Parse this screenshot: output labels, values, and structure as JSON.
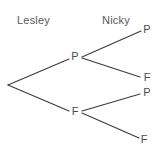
{
  "diagram": {
    "type": "probability-tree",
    "title": "",
    "background_color": "#ffffff",
    "line_color": "#3b3b3d",
    "text_color": "#58595b",
    "columns": [
      {
        "id": "lesley",
        "label": "Lesley",
        "x": 17,
        "y": 14
      },
      {
        "id": "nicky",
        "label": "Nicky",
        "x": 102,
        "y": 14
      }
    ],
    "nodes": [
      {
        "id": "root",
        "label": "",
        "stage": 0,
        "x": 8,
        "y": 85
      },
      {
        "id": "l-p",
        "label": "P",
        "stage": 1,
        "x": 75,
        "y": 57
      },
      {
        "id": "l-f",
        "label": "F",
        "stage": 1,
        "x": 75,
        "y": 112
      },
      {
        "id": "n-p-p",
        "label": "P",
        "stage": 2,
        "x": 147,
        "y": 30
      },
      {
        "id": "n-p-f",
        "label": "F",
        "stage": 2,
        "x": 147,
        "y": 78
      },
      {
        "id": "n-f-p",
        "label": "P",
        "stage": 2,
        "x": 147,
        "y": 93
      },
      {
        "id": "n-f-f",
        "label": "F",
        "stage": 2,
        "x": 144,
        "y": 140
      }
    ],
    "edges": [
      {
        "id": "root-to-l-p",
        "from": "root",
        "to": "l-p",
        "x1": 8,
        "y1": 85,
        "x2": 69,
        "y2": 59
      },
      {
        "id": "root-to-l-f",
        "from": "root",
        "to": "l-f",
        "x1": 8,
        "y1": 85,
        "x2": 69,
        "y2": 111
      },
      {
        "id": "l-p-to-n-p-p",
        "from": "l-p",
        "to": "n-p-p",
        "x1": 82,
        "y1": 57,
        "x2": 141,
        "y2": 31
      },
      {
        "id": "l-p-to-n-p-f",
        "from": "l-p",
        "to": "n-p-f",
        "x1": 82,
        "y1": 58,
        "x2": 140,
        "y2": 77
      },
      {
        "id": "l-f-to-n-f-p",
        "from": "l-f",
        "to": "n-f-p",
        "x1": 82,
        "y1": 111,
        "x2": 140,
        "y2": 94
      },
      {
        "id": "l-f-to-n-f-f",
        "from": "l-f",
        "to": "n-f-f",
        "x1": 82,
        "y1": 113,
        "x2": 139,
        "y2": 138
      }
    ]
  }
}
